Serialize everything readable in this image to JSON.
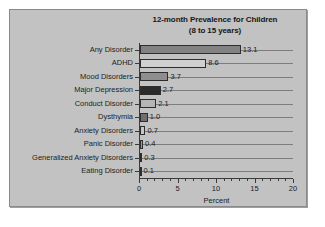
{
  "chart_data": {
    "type": "bar",
    "orientation": "horizontal",
    "title": "12-month Prevalence for Children",
    "subtitle": "(8 to 15 years)",
    "xlabel": "Percent",
    "ylabel": "",
    "xlim": [
      0,
      20
    ],
    "xticks": [
      0,
      5,
      10,
      15,
      20
    ],
    "xtick_labels": [
      "0",
      "5",
      "10",
      "15",
      "20"
    ],
    "minor_tick_interval": 1,
    "grid": "horizontal",
    "legend": "none",
    "categories": [
      "Any Disorder",
      "ADHD",
      "Mood Disorders",
      "Major Depression",
      "Conduct Disorder",
      "Dysthymia",
      "Anxiety Disorders",
      "Panic Disorder",
      "Generalized Anxiety Disorders",
      "Eating Disorder"
    ],
    "values": [
      13.1,
      8.6,
      3.7,
      2.7,
      2.1,
      1.0,
      0.7,
      0.4,
      0.3,
      0.1
    ],
    "value_labels": [
      "13.1",
      "8.6",
      "3.7",
      "2.7",
      "2.1",
      "1.0",
      "0.7",
      "0.4",
      "0.3",
      "0.1"
    ],
    "bar_colors": [
      "#828282",
      "#d0d0d0",
      "#8e8e8e",
      "#2b2b2b",
      "#b5b5b5",
      "#6f6f6f",
      "#c6c6c6",
      "#9a9a9a",
      "#1f1f1f",
      "#a8a8a8"
    ]
  },
  "figure": {
    "background_color": "#c2c2c2",
    "border_color": "#8a8a8a",
    "axis_color": "#3a3a3a",
    "gridline_color": "#7d7d7d",
    "text_color": "#1d1d1d"
  }
}
